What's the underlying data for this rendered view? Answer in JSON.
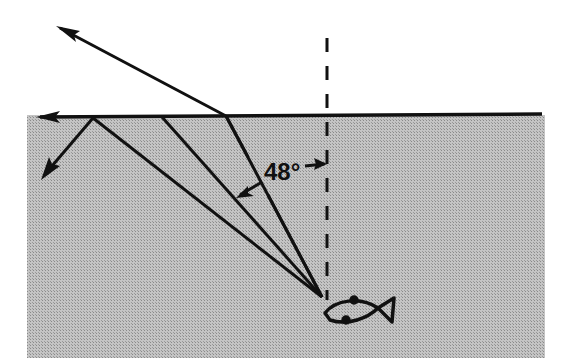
{
  "diagram": {
    "angle_label": "48°",
    "critical_angle_deg": 48,
    "regions": {
      "water": {
        "color": "#b9b9b9",
        "label": "water"
      },
      "air": {
        "color": "#ffffff",
        "label": "air"
      }
    },
    "elements": [
      {
        "id": "surface",
        "kind": "water surface line with arrow pointing left"
      },
      {
        "id": "normal",
        "kind": "dashed vertical normal line through fish"
      },
      {
        "id": "ray-refracted",
        "kind": "ray from fish refracted out of water into air"
      },
      {
        "id": "ray-critical",
        "kind": "ray from fish at critical angle, travelling along surface"
      },
      {
        "id": "ray-reflected",
        "kind": "ray from fish totally internally reflected back into water"
      },
      {
        "id": "fish",
        "kind": "fish outline (light source)"
      }
    ],
    "colors": {
      "ink": "#111111",
      "water": "#b9b9b9",
      "background": "#ffffff"
    }
  }
}
